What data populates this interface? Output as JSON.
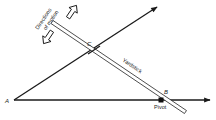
{
  "diagram": {
    "labels": {
      "point_a": "A",
      "point_b": "B",
      "point_c": "C",
      "yardstick": "Yardstick",
      "pivot": "Pivot",
      "directions_line1": "Directions",
      "directions_line2": "of motion"
    },
    "colors": {
      "line": "#1a1a1a",
      "background": "#ffffff",
      "text": "#222222"
    },
    "points": {
      "A": [
        14,
        100
      ],
      "B": [
        161,
        100
      ],
      "C": [
        94,
        50
      ],
      "upper_ray_end": [
        158,
        6
      ],
      "lower_ray_end": [
        211,
        100
      ]
    }
  }
}
